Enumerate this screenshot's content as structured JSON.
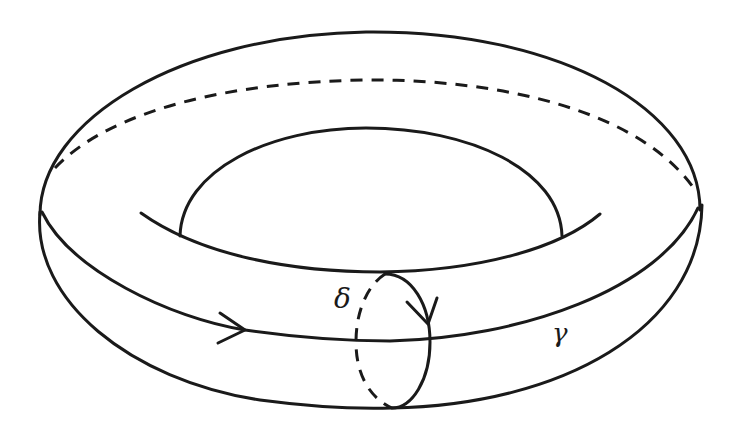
{
  "figure": {
    "labels": {
      "meridian": "δ",
      "longitude": "γ"
    },
    "colors": {
      "stroke": "#1a1a1a",
      "background": "#ffffff"
    }
  }
}
